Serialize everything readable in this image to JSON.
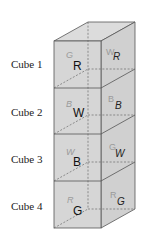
{
  "diagram": {
    "colors": {
      "front": "#d6d6d6",
      "side": "#d0d0d0",
      "top": "#dcdcdc",
      "edge": "#555555",
      "ghost": "#9a9a9a",
      "text": "#111111"
    },
    "cubes": [
      {
        "label": "Cube 1",
        "front": "R",
        "back_ghost": "G",
        "right": "R",
        "left_ghost": "W"
      },
      {
        "label": "Cube 2",
        "front": "W",
        "back_ghost": "B",
        "right": "B",
        "left_ghost": "B"
      },
      {
        "label": "Cube 3",
        "front": "B",
        "back_ghost": "W",
        "right": "W",
        "left_ghost": "G"
      },
      {
        "label": "Cube 4",
        "front": "G",
        "back_ghost": "R",
        "right": "G",
        "left_ghost": "R"
      }
    ]
  }
}
